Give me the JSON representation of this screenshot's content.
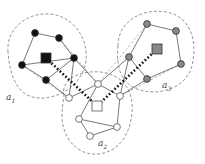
{
  "diagram": {
    "type": "clustered-graph",
    "clusters": [
      {
        "id": "a1",
        "label": "a",
        "sub": "1",
        "node_color": "#111111",
        "label_pos": [
          6,
          92
        ],
        "hull": "M 8 52 C 6 28, 28 12, 50 14 C 72 16, 88 36, 86 60 C 84 80, 66 96, 44 98 C 20 100, 10 80, 8 52 Z",
        "square": [
          46,
          58
        ],
        "nodes": [
          [
            35,
            33
          ],
          [
            59,
            38
          ],
          [
            22,
            65
          ],
          [
            46,
            80
          ],
          [
            74,
            58
          ]
        ],
        "edges": [
          [
            0,
            1
          ],
          [
            1,
            4
          ],
          [
            4,
            3
          ],
          [
            3,
            2
          ],
          [
            2,
            0
          ],
          [
            2,
            4
          ]
        ]
      },
      {
        "id": "a3",
        "label": "a",
        "sub": "3",
        "node_color": "#888888",
        "label_pos": [
          162,
          80
        ],
        "hull": "M 118 46 C 118 20, 144 8, 166 12 C 190 16, 198 40, 192 66 C 186 88, 160 96, 140 90 C 120 84, 116 66, 118 46 Z",
        "square": [
          157,
          49
        ],
        "nodes": [
          [
            147,
            24
          ],
          [
            176,
            31
          ],
          [
            181,
            64
          ],
          [
            147,
            79
          ],
          [
            129,
            57
          ]
        ],
        "edges": [
          [
            0,
            1
          ],
          [
            1,
            2
          ],
          [
            2,
            3
          ],
          [
            3,
            4
          ],
          [
            4,
            0
          ]
        ]
      },
      {
        "id": "a2",
        "label": "a",
        "sub": "2",
        "node_color": "#ffffff",
        "label_pos": [
          98,
          138
        ],
        "hull": "M 64 96 C 60 80, 80 70, 100 72 C 122 74, 134 90, 132 112 C 130 136, 118 152, 98 154 C 76 156, 62 136, 62 116 C 62 108, 63 102, 64 96 Z",
        "square": [
          97,
          106
        ],
        "nodes": [
          [
            98,
            84
          ],
          [
            69,
            98
          ],
          [
            120,
            96
          ],
          [
            79,
            119
          ],
          [
            117,
            127
          ],
          [
            90,
            136
          ]
        ],
        "edges": [
          [
            0,
            1
          ],
          [
            0,
            2
          ],
          [
            0,
            3
          ],
          [
            3,
            4
          ],
          [
            4,
            2
          ],
          [
            3,
            5
          ],
          [
            5,
            4
          ]
        ]
      }
    ],
    "inter_edges": [
      [
        [
          74,
          58
        ],
        [
          98,
          84
        ]
      ],
      [
        [
          129,
          57
        ],
        [
          98,
          84
        ]
      ],
      [
        [
          46,
          80
        ],
        [
          69,
          98
        ]
      ],
      [
        [
          147,
          79
        ],
        [
          120,
          96
        ]
      ],
      [
        [
          74,
          58
        ],
        [
          69,
          98
        ]
      ],
      [
        [
          129,
          57
        ],
        [
          120,
          96
        ]
      ]
    ],
    "dashed_inter": [
      [
        [
          59,
          38
        ],
        [
          98,
          84
        ]
      ],
      [
        [
          147,
          24
        ],
        [
          98,
          84
        ]
      ],
      [
        [
          22,
          65
        ],
        [
          69,
          98
        ]
      ],
      [
        [
          181,
          64
        ],
        [
          120,
          96
        ]
      ]
    ],
    "dotted_links": [
      [
        [
          46,
          58
        ],
        [
          97,
          106
        ]
      ],
      [
        [
          157,
          49
        ],
        [
          97,
          106
        ]
      ]
    ]
  },
  "labels": {
    "a1": "a",
    "a1_sub": "1",
    "a2": "a",
    "a2_sub": "2",
    "a3": "a",
    "a3_sub": "3"
  }
}
